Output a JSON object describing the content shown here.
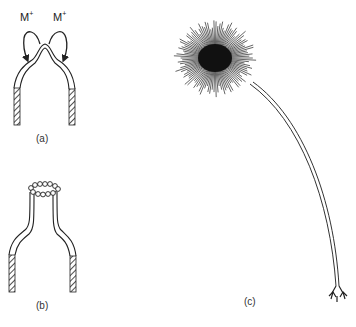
{
  "figure": {
    "panels": [
      {
        "id": "a",
        "label": "(a)",
        "description": "Tube with domed tip; cations M+ shown moving around the tip"
      },
      {
        "id": "b",
        "label": "(b)",
        "description": "Tube with narrowed neck and ring of beads at the tip"
      },
      {
        "id": "c",
        "label": "(c)",
        "description": "Dandelion-like radial burst on long curved stem"
      }
    ],
    "ions": [
      {
        "symbol": "M",
        "charge": "+"
      },
      {
        "symbol": "M",
        "charge": "+"
      }
    ]
  }
}
